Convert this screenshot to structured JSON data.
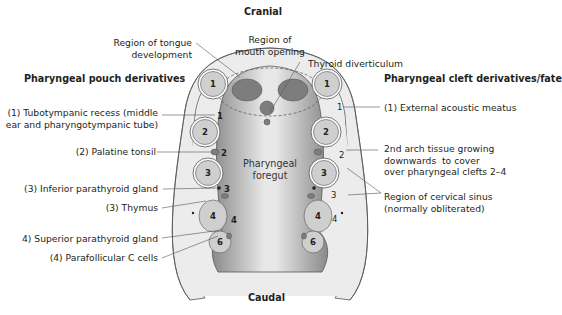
{
  "orientation": {
    "top": "Cranial",
    "bottom": "Caudal"
  },
  "headings": {
    "left": "Pharyngeal pouch derivatives",
    "right": "Pharyngeal cleft derivatives/fate"
  },
  "center_label": "Pharyngeal\nforegut",
  "top_labels": {
    "tongue": "Region of tongue\ndevelopment",
    "mouth": "Region of\nmouth opening",
    "thyroid": "Thyroid diverticulum"
  },
  "pouch_labels": [
    {
      "text": "(1) Tubotympanic recess (middle\near and pharyngotympanic tube)",
      "marker": "1"
    },
    {
      "text": "(2) Palatine tonsil",
      "marker": "2"
    },
    {
      "text": "(3) Inferior parathyroid gland",
      "marker": "3"
    },
    {
      "text": "(3) Thymus",
      "marker": ""
    },
    {
      "text": "4) Superior parathyroid gland",
      "marker": "4"
    },
    {
      "text": "(4) Parafollicular C cells",
      "marker": ""
    }
  ],
  "cleft_labels": [
    {
      "text": "(1) External acoustic meatus",
      "marker": "1"
    },
    {
      "text": "2nd arch tissue growing\ndownwards  to cover\nover pharyngeal clefts 2–4",
      "marker": "2"
    },
    {
      "text": "Region of cervical sinus\n(normally obliterated)",
      "marker": "3"
    }
  ],
  "cleft_marker_4": "4",
  "arches": [
    "1",
    "2",
    "3",
    "4",
    "6"
  ],
  "colors": {
    "foregut_dark": "#8c8c8c",
    "foregut_light": "#e6e6e6",
    "arch_fill": "#cfcfcf",
    "mesenchyme": "#ececec",
    "outline": "#555555",
    "leader": "#555555",
    "text": "#231f20"
  }
}
